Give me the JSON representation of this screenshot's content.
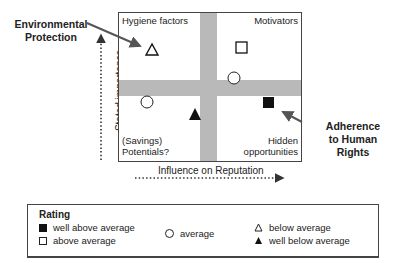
{
  "matrix": {
    "quadrants": {
      "top_left": "Hygiene factors",
      "top_right": "Motivators",
      "bottom_left_line1": "(Savings)",
      "bottom_left_line2": "Potentials?",
      "bottom_right_line1": "Hidden",
      "bottom_right_line2": "opportunities"
    },
    "x_axis_label": "Influence on Reputation",
    "y_axis_label": "Stated importance",
    "markers": [
      {
        "symbol": "triangle-open",
        "rating": "below average",
        "x": 152,
        "y": 50
      },
      {
        "symbol": "square-open",
        "rating": "above average",
        "x": 241,
        "y": 47
      },
      {
        "symbol": "circle",
        "rating": "average",
        "x": 234,
        "y": 77
      },
      {
        "symbol": "circle",
        "rating": "average",
        "x": 147,
        "y": 102
      },
      {
        "symbol": "triangle-filled",
        "rating": "well below average",
        "x": 195,
        "y": 115
      },
      {
        "symbol": "square-filled",
        "rating": "well above average",
        "x": 268,
        "y": 103
      }
    ]
  },
  "callouts": {
    "environmental_line1": "Environmental",
    "environmental_line2": "Protection",
    "human_rights_line1": "Adherence",
    "human_rights_line2": "to Human",
    "human_rights_line3": "Rights"
  },
  "legend": {
    "title": "Rating",
    "items": [
      {
        "symbol": "square-filled",
        "label": "well above average"
      },
      {
        "symbol": "square-open",
        "label": "above average"
      },
      {
        "symbol": "circle",
        "label": "average"
      },
      {
        "symbol": "triangle-open",
        "label": "below average"
      },
      {
        "symbol": "triangle-filled",
        "label": "well below average"
      }
    ]
  }
}
